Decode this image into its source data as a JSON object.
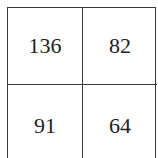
{
  "grid": {
    "rows": [
      [
        "136",
        "82"
      ],
      [
        "91",
        "64"
      ]
    ]
  }
}
